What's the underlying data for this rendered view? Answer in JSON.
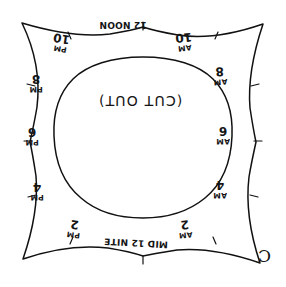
{
  "document": {
    "type": "hand-drawn sundial dial-plate cutting template",
    "center_text": "(CUT OUT)",
    "corner_mark": "C"
  },
  "hour_labels": [
    {
      "id": "noon",
      "number": "12",
      "meridiem": "NOON",
      "full": "12 NOON",
      "position": "top-center"
    },
    {
      "id": "10am",
      "number": "10",
      "meridiem": "AM",
      "full": "10 AM",
      "position": "top-right"
    },
    {
      "id": "8am",
      "number": "8",
      "meridiem": "AM",
      "full": "8 AM",
      "position": "right-upper"
    },
    {
      "id": "6am",
      "number": "6",
      "meridiem": "AM",
      "full": "6 AM",
      "position": "right-middle"
    },
    {
      "id": "4am",
      "number": "4",
      "meridiem": "AM",
      "full": "4 AM",
      "position": "right-lower"
    },
    {
      "id": "2am",
      "number": "2",
      "meridiem": "AM",
      "full": "2 AM",
      "position": "bottom-right"
    },
    {
      "id": "midnite",
      "number": "12",
      "meridiem": "MID NITE",
      "full": "MID 12 NITE",
      "position": "bottom-center"
    },
    {
      "id": "2pm",
      "number": "2",
      "meridiem": "PM",
      "full": "2 PM",
      "position": "bottom-left"
    },
    {
      "id": "4pm",
      "number": "4",
      "meridiem": "PM",
      "full": "4 PM",
      "position": "left-lower"
    },
    {
      "id": "6pm",
      "number": "6",
      "meridiem": "PM",
      "full": "6 PM",
      "position": "left-middle"
    },
    {
      "id": "8pm",
      "number": "8",
      "meridiem": "PM",
      "full": "8 PM",
      "position": "left-upper"
    },
    {
      "id": "10pm",
      "number": "10",
      "meridiem": "PM",
      "full": "10 PM",
      "position": "top-left"
    }
  ],
  "midnite_parts": {
    "left": "MID",
    "number": "12",
    "right": "NITE"
  },
  "colors": {
    "ink": "#111111",
    "paper": "#ffffff"
  }
}
